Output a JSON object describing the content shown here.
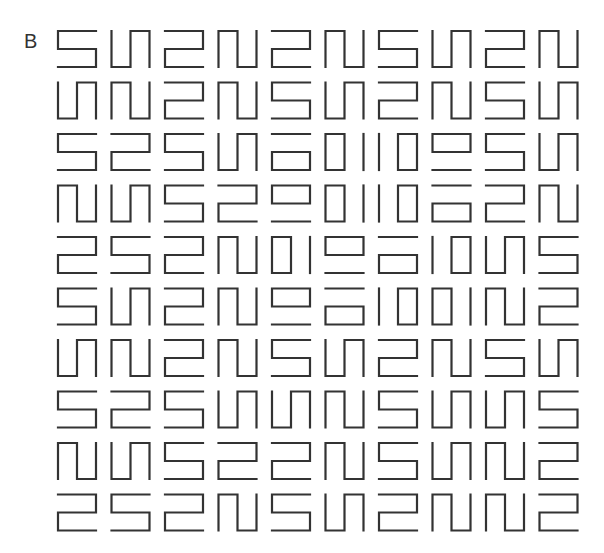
{
  "panel": {
    "label": "B"
  },
  "grid": {
    "rows": 10,
    "cols": 10,
    "origin_x": 58,
    "origin_y": 31,
    "step_x": 53.5,
    "step_y": 51.5,
    "cell_w": 38,
    "cell_h": 36,
    "stroke_color": "#333333",
    "stroke_width": 2.2,
    "legend": {
      "S": "five-shape",
      "Z": "two-shape",
      "N": "cap-left-cup-right",
      "U": "cup-left-cap-right",
      "RL": "rect-left-line-right",
      "LR": "line-left-rect-right",
      "TB": "line-top-rect-bottom",
      "BT": "rect-top-line-bottom"
    },
    "cells": [
      [
        "S",
        "U",
        "Z",
        "N",
        "Z",
        "N",
        "S",
        "U",
        "Z",
        "N"
      ],
      [
        "U",
        "N",
        "Z",
        "N",
        "S",
        "U",
        "Z",
        "N",
        "S",
        "U"
      ],
      [
        "S",
        "Z",
        "S",
        "U",
        "TB",
        "RL",
        "LR",
        "BT",
        "S",
        "U"
      ],
      [
        "N",
        "U",
        "S",
        "Z",
        "BT",
        "RL",
        "LR",
        "TB",
        "Z",
        "N"
      ],
      [
        "Z",
        "S",
        "Z",
        "N",
        "RL",
        "BT",
        "TB",
        "LR",
        "U",
        "S"
      ],
      [
        "S",
        "U",
        "Z",
        "N",
        "BT",
        "TB",
        "LR",
        "RL",
        "N",
        "Z"
      ],
      [
        "U",
        "N",
        "Z",
        "N",
        "S",
        "U",
        "Z",
        "N",
        "S",
        "U"
      ],
      [
        "S",
        "Z",
        "S",
        "U",
        "U",
        "N",
        "S",
        "U",
        "U",
        "S"
      ],
      [
        "N",
        "U",
        "S",
        "Z",
        "Z",
        "N",
        "S",
        "U",
        "N",
        "Z"
      ],
      [
        "Z",
        "S",
        "Z",
        "N",
        "S",
        "U",
        "Z",
        "N",
        "N",
        "Z"
      ]
    ]
  }
}
